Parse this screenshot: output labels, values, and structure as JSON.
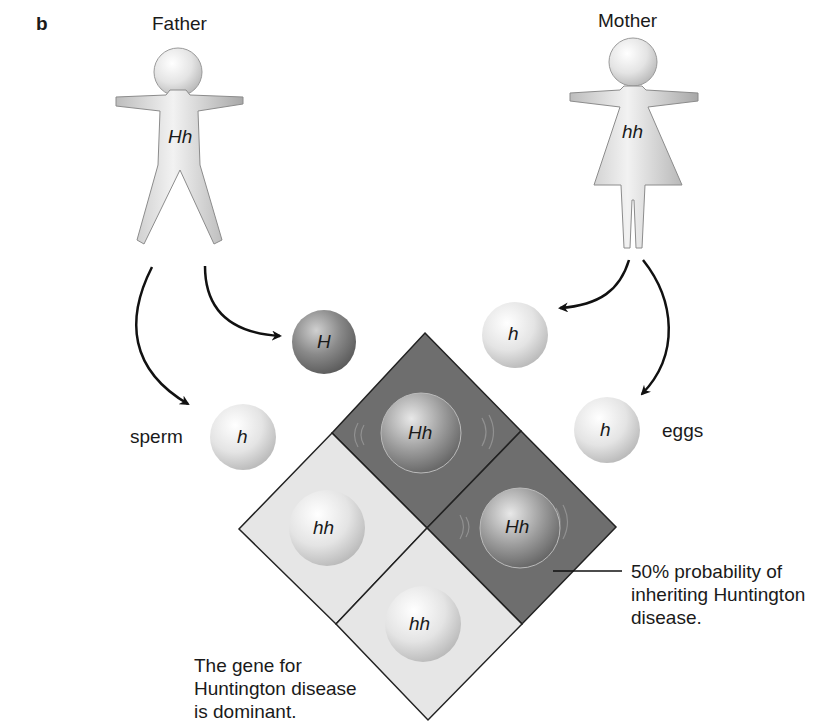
{
  "panel_label": "b",
  "parents": {
    "father": {
      "label": "Father",
      "genotype": "Hh"
    },
    "mother": {
      "label": "Mother",
      "genotype": "hh"
    }
  },
  "gametes": {
    "sperm_label": "sperm",
    "eggs_label": "eggs",
    "sperm": [
      {
        "allele": "H",
        "shade": "dark"
      },
      {
        "allele": "h",
        "shade": "light"
      }
    ],
    "eggs": [
      {
        "allele": "h",
        "shade": "light"
      },
      {
        "allele": "h",
        "shade": "light"
      }
    ]
  },
  "punnett_square": {
    "cells": [
      {
        "position": "top",
        "genotype": "Hh",
        "affected": true
      },
      {
        "position": "right",
        "genotype": "Hh",
        "affected": true
      },
      {
        "position": "left",
        "genotype": "hh",
        "affected": false
      },
      {
        "position": "bottom",
        "genotype": "hh",
        "affected": false
      }
    ]
  },
  "annotations": {
    "probability": [
      "50% probability of",
      "inheriting Huntington",
      "disease."
    ],
    "dominance": [
      "The gene for",
      "Huntington disease",
      "is dominant."
    ]
  },
  "colors": {
    "affected_cell": "#6e6e6e",
    "unaffected_cell": "#e6e6e6",
    "dark_sphere": "#7a7a7a",
    "light_sphere": "#ececec",
    "figure": "#d8d8d8"
  }
}
